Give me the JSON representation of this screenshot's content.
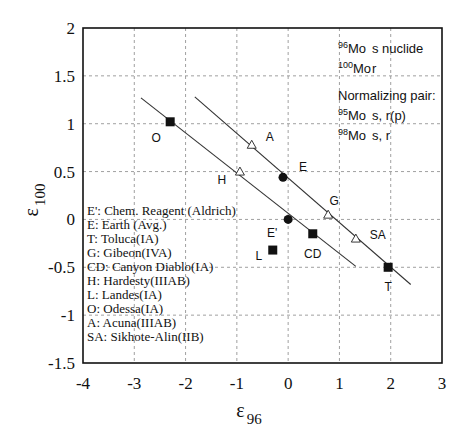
{
  "chart_data": {
    "type": "scatter",
    "title": "",
    "xlabel": "ε96",
    "xlabel_main": "ε",
    "xlabel_sub": "96",
    "ylabel": "ε100",
    "ylabel_main": "ε",
    "ylabel_sub": "100",
    "xlim": [
      -4,
      3
    ],
    "ylim": [
      -1.5,
      2
    ],
    "xticks": [
      "-4",
      "-3",
      "-2",
      "-1",
      "0",
      "1",
      "2",
      "3"
    ],
    "yticks": [
      "2",
      "1.5",
      "1",
      "0.5",
      "0",
      "-0.5",
      "-1",
      "-1.5"
    ],
    "grid": true,
    "points": [
      {
        "label": "O",
        "x": -2.3,
        "y": 1.02,
        "marker": "square"
      },
      {
        "label": "A",
        "x": -0.71,
        "y": 0.78,
        "marker": "triangle"
      },
      {
        "label": "H",
        "x": -0.94,
        "y": 0.5,
        "marker": "triangle"
      },
      {
        "label": "E",
        "x": -0.1,
        "y": 0.44,
        "marker": "circle"
      },
      {
        "label": "E'",
        "x": 0.0,
        "y": 0.0,
        "marker": "circle"
      },
      {
        "label": "G",
        "x": 0.78,
        "y": 0.05,
        "marker": "triangle"
      },
      {
        "label": "CD",
        "x": 0.48,
        "y": -0.15,
        "marker": "square"
      },
      {
        "label": "SA",
        "x": 1.32,
        "y": -0.2,
        "marker": "triangle"
      },
      {
        "label": "L",
        "x": -0.3,
        "y": -0.32,
        "marker": "square"
      },
      {
        "label": "T",
        "x": 1.95,
        "y": -0.5,
        "marker": "square"
      }
    ],
    "lines": [
      {
        "name": "lower-trend",
        "x": [
          -2.87,
          1.32
        ],
        "y": [
          1.27,
          -0.49
        ]
      },
      {
        "name": "upper-trend",
        "x": [
          -1.82,
          2.39
        ],
        "y": [
          1.28,
          -0.68
        ]
      }
    ],
    "legend": [
      "E':  Chem. Reagent (Aldrich)",
      "E: Earth (Avg.)",
      "T: Toluca(IA)",
      "G: Gibeon(IVA)",
      "CD: Canyon Diablo(IA)",
      "H: Hardesty(IIIAB)",
      "L: Landes(IA)",
      "O: Odessa(IA)",
      "A: Acuna(IIIAB)",
      "SA: Sikhote-Alin(IIB)"
    ],
    "annotations": {
      "nuclides": [
        {
          "mass": "96",
          "element": "Mo",
          "desc": "s nuclide"
        },
        {
          "mass": "100",
          "element": "Mo",
          "desc": "r"
        }
      ],
      "normalizing_title": "Normalizing pair:",
      "normalizing": [
        {
          "mass": "95",
          "element": "Mo",
          "desc": "s, r(p)"
        },
        {
          "mass": "98",
          "element": "Mo",
          "desc": "s, r"
        }
      ]
    }
  }
}
